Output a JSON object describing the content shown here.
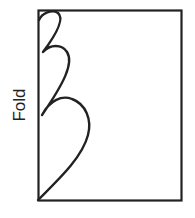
{
  "diagram": {
    "label": "Fold",
    "colors": {
      "stroke": "#222222",
      "background": "#ffffff"
    },
    "shapes": {
      "rectangle": {
        "x": 38,
        "y": 10,
        "width": 143,
        "height": 190
      },
      "cut_line": "three-lobed curve along fold edge"
    }
  }
}
